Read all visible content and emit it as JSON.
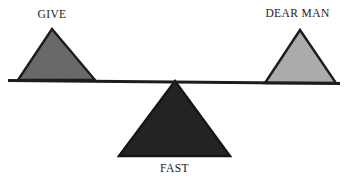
{
  "diagram": {
    "name": "balance-scale-diagram",
    "background_color": "#ffffff",
    "beam": {
      "name": "balance-beam",
      "color": "#1c1c1c",
      "left_end": {
        "x": 8,
        "y": 80
      },
      "right_end": {
        "x": 340,
        "y": 83
      },
      "thickness": 3
    },
    "fulcrum": {
      "name": "fulcrum-triangle",
      "label": "FAST",
      "fill_color": "#232323",
      "stroke_color": "#151515",
      "apex": {
        "x": 175,
        "y": 81
      },
      "base_left": {
        "x": 119,
        "y": 156
      },
      "base_right": {
        "x": 230,
        "y": 156
      },
      "label_position": "below"
    },
    "left_weight": {
      "name": "left-weight-triangle",
      "label": "GIVE",
      "fill_color": "#696969",
      "stroke_color": "#1c1c1c",
      "apex": {
        "x": 52,
        "y": 29
      },
      "base_left": {
        "x": 18,
        "y": 79
      },
      "base_right": {
        "x": 95,
        "y": 79
      },
      "label_position": "above"
    },
    "right_weight": {
      "name": "right-weight-triangle",
      "label": "DEAR MAN",
      "fill_color": "#ababab",
      "stroke_color": "#1c1c1c",
      "apex": {
        "x": 300,
        "y": 30
      },
      "base_left": {
        "x": 265,
        "y": 82
      },
      "base_right": {
        "x": 336,
        "y": 82
      },
      "label_position": "above"
    },
    "labels": {
      "left": "GIVE",
      "right": "DEAR MAN",
      "center": "FAST"
    }
  }
}
